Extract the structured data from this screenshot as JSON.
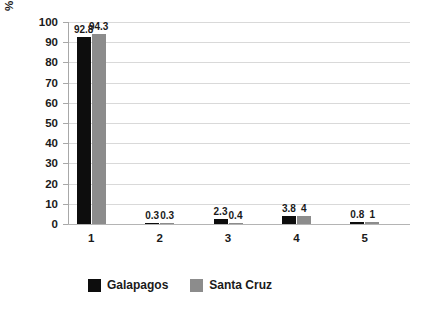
{
  "chart_data": {
    "type": "bar",
    "title": "",
    "subtitle": "",
    "xlabel": "",
    "ylabel": "% waste disposal methods",
    "categories": [
      "1",
      "2",
      "3",
      "4",
      "5"
    ],
    "ylim": [
      0,
      100
    ],
    "yticks": [
      "0",
      "10",
      "20",
      "30",
      "40",
      "50",
      "60",
      "70",
      "80",
      "90",
      "100"
    ],
    "grid": true,
    "legend_position": "bottom",
    "series": [
      {
        "name": "Galapagos",
        "color": "#0d0d0d",
        "values": [
          92.8,
          0.3,
          2.3,
          3.8,
          0.8
        ],
        "labels": [
          "92.8",
          "0.3",
          "2.3",
          "3.8",
          "0.8"
        ]
      },
      {
        "name": "Santa Cruz",
        "color": "#8c8c8c",
        "values": [
          94.3,
          0.3,
          0.4,
          4,
          1
        ],
        "labels": [
          "94.3",
          "0.3",
          "0.4",
          "4",
          "1"
        ]
      }
    ]
  },
  "colors": {
    "background": "#ffffff",
    "gridline": "#d9d9d9",
    "axis": "#a8a8a8",
    "text": "#1a1a1a"
  }
}
